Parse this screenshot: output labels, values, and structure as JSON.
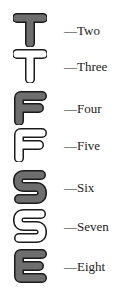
{
  "colors": {
    "filled": "#6e6e6e",
    "hollow": "#ffffff",
    "outline": "#1a1a1a"
  },
  "items": [
    {
      "letter": "T",
      "style": "filled",
      "label": "—Two"
    },
    {
      "letter": "T",
      "style": "hollow",
      "label": "—Three"
    },
    {
      "letter": "F",
      "style": "filled",
      "label": "—Four"
    },
    {
      "letter": "F",
      "style": "hollow",
      "label": "—Five"
    },
    {
      "letter": "S",
      "style": "filled",
      "label": "—Six"
    },
    {
      "letter": "S",
      "style": "hollow",
      "label": "—Seven"
    },
    {
      "letter": "E",
      "style": "filled",
      "label": "—Eight"
    }
  ]
}
